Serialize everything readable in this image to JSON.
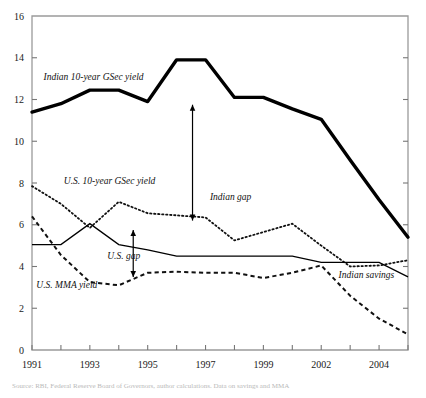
{
  "chart_data": {
    "type": "line",
    "title": "",
    "xlabel": "",
    "ylabel": "",
    "ylim": [
      0,
      16
    ],
    "ytick_step": 2,
    "yticks": [
      "0",
      "2",
      "4",
      "6",
      "8",
      "10",
      "12",
      "14",
      "16"
    ],
    "xticks": [
      "1991",
      "1993",
      "1995",
      "1997",
      "1999",
      "2002",
      "2004"
    ],
    "x": [
      1991,
      1992,
      1993,
      1994,
      1995,
      1996,
      1997,
      1998,
      1999,
      2000,
      2002,
      2003,
      2004,
      2005
    ],
    "grid": false,
    "legend_position": "inline-annotations",
    "series": [
      {
        "name": "Indian 10-year GSec yield",
        "style": "thick-solid",
        "color": "#000000",
        "label_x": 1991.4,
        "label_y": 12.95,
        "values": [
          11.4,
          11.8,
          12.45,
          12.45,
          11.9,
          13.9,
          13.9,
          12.1,
          12.1,
          11.55,
          11.05,
          9.1,
          7.2,
          5.4
        ]
      },
      {
        "name": "U.S. 10-year GSec yield",
        "style": "dotted",
        "color": "#111111",
        "label_x": 1992.1,
        "label_y": 7.95,
        "values": [
          7.85,
          7.0,
          5.85,
          7.1,
          6.55,
          6.45,
          6.35,
          5.25,
          5.65,
          6.05,
          5.0,
          4.0,
          4.05,
          4.3
        ]
      },
      {
        "name": "Indian savings",
        "style": "thin-solid",
        "color": "#000000",
        "label_x": 2002.6,
        "label_y": 3.45,
        "values": [
          5.05,
          5.05,
          6.05,
          5.05,
          4.8,
          4.5,
          4.5,
          4.5,
          4.5,
          4.5,
          4.2,
          4.2,
          4.2,
          3.5
        ]
      },
      {
        "name": "U.S. MMA yield",
        "style": "dashed",
        "color": "#111111",
        "label_x": 1991.15,
        "label_y": 2.95,
        "values": [
          6.4,
          4.55,
          3.25,
          3.1,
          3.7,
          3.75,
          3.7,
          3.7,
          3.45,
          3.7,
          4.05,
          2.6,
          1.5,
          0.75
        ]
      }
    ],
    "annotations": [
      {
        "name": "indian-gap",
        "label": "Indian gap",
        "label_x": 1997.15,
        "label_y": 7.2,
        "arrow_x": 1996.55,
        "arrow_top": 11.75,
        "arrow_bottom": 6.2,
        "double_headed": true
      },
      {
        "name": "us-gap",
        "label": "U.S. gap",
        "label_x": 1993.6,
        "label_y": 4.35,
        "arrow_x": 1994.5,
        "arrow_top": 5.75,
        "arrow_bottom": 3.5,
        "double_headed": true
      }
    ],
    "axis_colors": {
      "frame": "#9a9a9a",
      "tick": "#777777",
      "text": "#1a1a1a"
    }
  },
  "source_note": "Source: RBI, Federal Reserve Board of Governors, author calculations. Data on savings and MMA",
  "top_note": ""
}
